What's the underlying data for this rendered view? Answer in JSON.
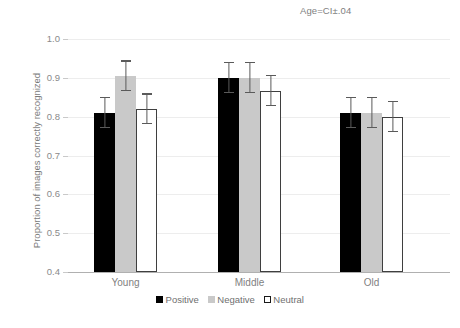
{
  "chart_data": {
    "type": "bar",
    "title": "Age=CI±.04",
    "xlabel": "",
    "ylabel": "Proportion of images correctly recognized",
    "categories": [
      "Young",
      "Middle",
      "Old"
    ],
    "series": [
      {
        "name": "Positive",
        "color": "#000000",
        "values": [
          0.81,
          0.9,
          0.81
        ],
        "errors": [
          0.04,
          0.04,
          0.04
        ]
      },
      {
        "name": "Negative",
        "color": "#c9c9c9",
        "values": [
          0.905,
          0.9,
          0.81
        ],
        "errors": [
          0.04,
          0.04,
          0.04
        ]
      },
      {
        "name": "Neutral",
        "color": "#ffffff",
        "values": [
          0.82,
          0.867,
          0.8
        ],
        "errors": [
          0.04,
          0.04,
          0.04
        ]
      }
    ],
    "ylim": [
      0.4,
      1.0
    ],
    "ytick_values": [
      1.0,
      0.9,
      0.8,
      0.7,
      0.6,
      0.5,
      0.4
    ],
    "ytick_labels": [
      "1.0",
      "0.9",
      "0.8",
      "0.7",
      "0.6",
      "0.5",
      "0.4"
    ],
    "grid": true,
    "grid_axis": "y",
    "legend_position": "bottom",
    "error_bar_type": "CI",
    "error_bar_value": 0.04
  },
  "axis": {
    "y_title": "Proportion of images correctly recognized"
  },
  "annotation": {
    "text": "Age=CI±.04"
  },
  "legend": {
    "items": [
      {
        "label": "Positive"
      },
      {
        "label": "Negative"
      },
      {
        "label": "Neutral"
      }
    ]
  },
  "colors": {
    "positive": "#000000",
    "negative": "#c9c9c9",
    "neutral_fill": "#ffffff",
    "neutral_border": "#3f3f3f",
    "gridline": "#ededed",
    "axis": "#b0b0b0",
    "text": "#7f7f7f",
    "errorbar": "#5a5a5a"
  }
}
